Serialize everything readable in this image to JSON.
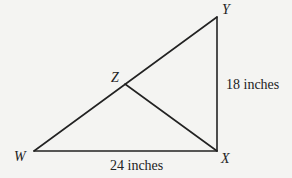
{
  "diagram": {
    "type": "geometry-triangle",
    "colors": {
      "background": "#f4f4f2",
      "stroke": "#222222",
      "text": "#222222"
    },
    "vertices": {
      "W": {
        "label": "W",
        "x": 34,
        "y": 151
      },
      "X": {
        "label": "X",
        "x": 217,
        "y": 151
      },
      "Y": {
        "label": "Y",
        "x": 217,
        "y": 17
      },
      "Z": {
        "label": "Z",
        "x": 125,
        "y": 84
      }
    },
    "segments": [
      {
        "from": "W",
        "to": "X"
      },
      {
        "from": "X",
        "to": "Y"
      },
      {
        "from": "W",
        "to": "Y"
      },
      {
        "from": "Z",
        "to": "X"
      }
    ],
    "dimensions": {
      "WX": "24 inches",
      "XY": "18 inches"
    }
  }
}
